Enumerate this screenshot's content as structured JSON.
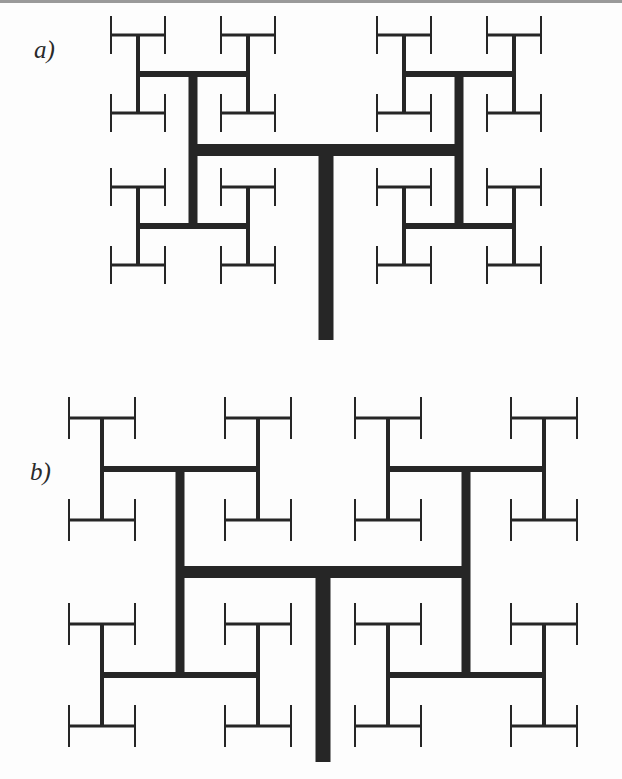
{
  "figure": {
    "panels": [
      {
        "id": "a",
        "label": "a)",
        "description": "H-tree fractal (depth 5) with trunk; top branch-level arms, thick lines thinning at each level",
        "trunk": {
          "x": 326,
          "y_top": 150,
          "y_bottom": 340,
          "width": 15
        },
        "stroke_color": "#262626"
      },
      {
        "id": "b",
        "label": "b)",
        "description": "H-tree fractal (depth 5) with trunk, more widely spread branches",
        "trunk": {
          "x": 323,
          "y_top": 572,
          "y_bottom": 762,
          "width": 15
        },
        "stroke_color": "#262626"
      }
    ]
  }
}
